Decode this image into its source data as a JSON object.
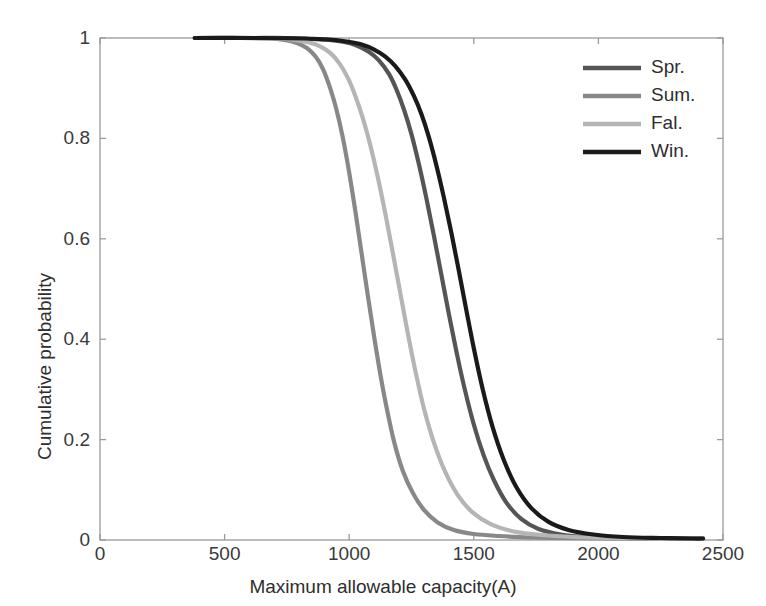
{
  "chart_data": {
    "type": "line",
    "title": "",
    "xlabel": "Maximum allowable capacity(A)",
    "ylabel": "Cumulative probability",
    "xlim": [
      0,
      2500
    ],
    "ylim": [
      0,
      1
    ],
    "xticks": [
      0,
      500,
      1000,
      1500,
      2000,
      2500
    ],
    "xticklabels": [
      "0",
      "500",
      "1000",
      "1500",
      "2000",
      "2500"
    ],
    "yticks": [
      0,
      0.2,
      0.4,
      0.6,
      0.8,
      1
    ],
    "yticklabels": [
      "0",
      "0.2",
      "0.4",
      "0.6",
      "0.8",
      "1"
    ],
    "grid": false,
    "legend_position": "upper right",
    "series": [
      {
        "name": "Spr.",
        "color": "#555555",
        "x": [
          380,
          600,
          750,
          850,
          920,
          980,
          1030,
          1080,
          1120,
          1160,
          1190,
          1220,
          1250,
          1280,
          1310,
          1340,
          1370,
          1400,
          1430,
          1460,
          1500,
          1540,
          1580,
          1630,
          1690,
          1760,
          1850,
          1950,
          2100,
          2300,
          2420
        ],
        "y": [
          1.0,
          1.0,
          1.0,
          0.998,
          0.996,
          0.992,
          0.985,
          0.972,
          0.955,
          0.928,
          0.897,
          0.857,
          0.808,
          0.748,
          0.68,
          0.606,
          0.528,
          0.45,
          0.376,
          0.308,
          0.23,
          0.168,
          0.12,
          0.075,
          0.042,
          0.022,
          0.011,
          0.006,
          0.004,
          0.003,
          0.003
        ]
      },
      {
        "name": "Sum.",
        "color": "#888888",
        "x": [
          380,
          560,
          680,
          740,
          790,
          830,
          865,
          895,
          925,
          950,
          975,
          1000,
          1025,
          1050,
          1075,
          1100,
          1125,
          1150,
          1180,
          1215,
          1255,
          1300,
          1355,
          1420,
          1500,
          1600,
          1720,
          1860,
          2050,
          2300,
          2420
        ],
        "y": [
          1.0,
          1.0,
          0.999,
          0.996,
          0.99,
          0.98,
          0.963,
          0.938,
          0.898,
          0.855,
          0.8,
          0.732,
          0.654,
          0.57,
          0.486,
          0.405,
          0.33,
          0.264,
          0.196,
          0.138,
          0.094,
          0.06,
          0.035,
          0.02,
          0.012,
          0.008,
          0.005,
          0.004,
          0.003,
          0.003,
          0.003
        ]
      },
      {
        "name": "Fal.",
        "color": "#b5b5b5",
        "x": [
          380,
          580,
          700,
          780,
          840,
          885,
          925,
          960,
          995,
          1025,
          1055,
          1085,
          1115,
          1145,
          1175,
          1205,
          1235,
          1265,
          1300,
          1340,
          1385,
          1435,
          1495,
          1570,
          1660,
          1770,
          1900,
          2050,
          2200,
          2350,
          2420
        ],
        "y": [
          1.0,
          1.0,
          0.999,
          0.996,
          0.991,
          0.983,
          0.97,
          0.95,
          0.92,
          0.884,
          0.84,
          0.786,
          0.722,
          0.65,
          0.572,
          0.492,
          0.412,
          0.338,
          0.262,
          0.194,
          0.136,
          0.09,
          0.055,
          0.031,
          0.017,
          0.01,
          0.006,
          0.004,
          0.003,
          0.003,
          0.003
        ]
      },
      {
        "name": "Win.",
        "color": "#1a1a1a",
        "x": [
          380,
          650,
          820,
          920,
          990,
          1050,
          1100,
          1145,
          1185,
          1225,
          1260,
          1290,
          1320,
          1350,
          1380,
          1410,
          1440,
          1470,
          1500,
          1535,
          1575,
          1620,
          1670,
          1730,
          1800,
          1880,
          1980,
          2100,
          2250,
          2380,
          2420
        ],
        "y": [
          1.0,
          1.0,
          0.999,
          0.997,
          0.993,
          0.987,
          0.977,
          0.963,
          0.944,
          0.917,
          0.884,
          0.848,
          0.802,
          0.746,
          0.682,
          0.612,
          0.536,
          0.458,
          0.382,
          0.302,
          0.226,
          0.16,
          0.106,
          0.064,
          0.036,
          0.02,
          0.011,
          0.006,
          0.004,
          0.003,
          0.003
        ]
      }
    ]
  },
  "axes": {
    "plot_left_px": 100,
    "plot_right_px": 723,
    "plot_top_px": 38,
    "plot_bottom_px": 540,
    "frame_color": "#9a9a9a"
  },
  "legend": {
    "entries": [
      {
        "label": "Spr.",
        "color": "#555555"
      },
      {
        "label": "Sum.",
        "color": "#888888"
      },
      {
        "label": "Fal.",
        "color": "#b5b5b5"
      },
      {
        "label": "Win.",
        "color": "#1a1a1a"
      }
    ],
    "swatch_x_px": 583,
    "swatch_w_px": 58,
    "label_x_px": 651,
    "first_y_px": 68,
    "row_step_px": 28
  }
}
